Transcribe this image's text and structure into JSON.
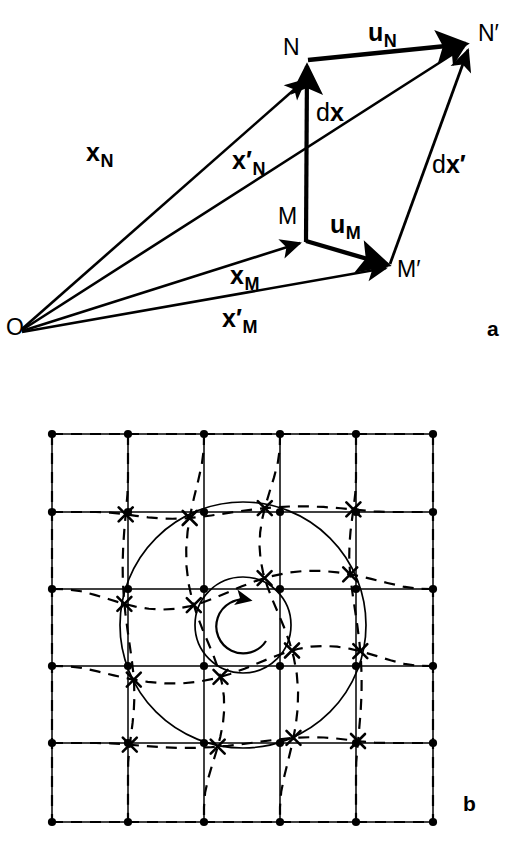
{
  "figure": {
    "background_color": "#ffffff",
    "ink_color": "#000000",
    "width": 526,
    "height": 848
  },
  "panel_a": {
    "tag": "a",
    "description": "Vector parallelogram showing position vectors from origin O to material points M and N, their displaced positions M' and N', displacement vectors u_M and u_N, and line elements dx and dx'.",
    "points": [
      {
        "name": "O",
        "label": "O",
        "x": 20,
        "y": 330
      },
      {
        "name": "M",
        "label": "M",
        "x": 305,
        "y": 240
      },
      {
        "name": "N",
        "label": "N",
        "x": 310,
        "y": 75
      },
      {
        "name": "Mp",
        "label": "M′",
        "x": 390,
        "y": 267
      },
      {
        "name": "Np",
        "label": "N′",
        "x": 470,
        "y": 42
      }
    ],
    "point_labels": [
      {
        "name": "label-O",
        "text": "O",
        "x": 6,
        "y": 316
      },
      {
        "name": "label-N",
        "text": "N",
        "x": 283,
        "y": 36
      },
      {
        "name": "label-Np",
        "text": "N′",
        "x": 478,
        "y": 22
      },
      {
        "name": "label-M",
        "text": "M",
        "x": 278,
        "y": 205
      },
      {
        "name": "label-Mp",
        "text": "M′",
        "x": 397,
        "y": 258
      }
    ],
    "vector_labels": [
      {
        "name": "label-x-N",
        "base": "x",
        "sub": "N",
        "prime": false,
        "upright": "",
        "x": 86,
        "y": 140
      },
      {
        "name": "label-x-N-prime",
        "base": "x",
        "sub": "N",
        "prime": true,
        "upright": "",
        "x": 232,
        "y": 148
      },
      {
        "name": "label-x-M",
        "base": "x",
        "sub": "M",
        "prime": false,
        "upright": "",
        "x": 230,
        "y": 263
      },
      {
        "name": "label-x-M-prime",
        "base": "x",
        "sub": "M",
        "prime": true,
        "upright": "",
        "x": 222,
        "y": 306
      },
      {
        "name": "label-u-N",
        "base": "u",
        "sub": "N",
        "prime": false,
        "upright": "",
        "x": 368,
        "y": 20
      },
      {
        "name": "label-u-M",
        "base": "u",
        "sub": "M",
        "prime": false,
        "upright": "",
        "x": 330,
        "y": 212
      },
      {
        "name": "label-dx",
        "base": "x",
        "sub": "",
        "prime": false,
        "upright": "d",
        "x": 316,
        "y": 100
      },
      {
        "name": "label-dx-prime",
        "base": "x",
        "sub": "",
        "prime": true,
        "upright": "d",
        "x": 432,
        "y": 152
      }
    ],
    "arrows": [
      {
        "name": "arrow-x-N",
        "from": "O",
        "to": "N",
        "label": "x_N",
        "weight": "thin"
      },
      {
        "name": "arrow-x-N-prime",
        "from": "O",
        "to": "Np",
        "label": "x'_N",
        "weight": "thin"
      },
      {
        "name": "arrow-x-M",
        "from": "O",
        "to": "M",
        "label": "x_M",
        "weight": "thin"
      },
      {
        "name": "arrow-x-M-prime",
        "from": "O",
        "to": "Mp",
        "label": "x'_M",
        "weight": "thin"
      },
      {
        "name": "arrow-u-N",
        "from": "N",
        "to": "Np",
        "label": "u_N",
        "weight": "thick"
      },
      {
        "name": "arrow-u-M",
        "from": "M",
        "to": "Mp",
        "label": "u_M",
        "weight": "thick"
      },
      {
        "name": "arrow-dx",
        "from": "M",
        "to": "N",
        "label": "dx",
        "weight": "thick"
      },
      {
        "name": "arrow-dx-prime",
        "from": "Mp",
        "to": "Np",
        "label": "dx'",
        "weight": "thin"
      }
    ]
  },
  "panel_b": {
    "tag": "b",
    "description": "Square reference grid (solid, dots at nodes) and the same grid after a localized rotational deformation (dashed, crosses at nodes), with two concentric circles and a counterclockwise rotation arrow at the centre.",
    "grid": {
      "columns": 5,
      "rows": 5,
      "x_positions": [
        52,
        128,
        204,
        280,
        356,
        433
      ],
      "y_positions": [
        434,
        512,
        589,
        666,
        743,
        822
      ],
      "node_marker": "dot",
      "line_style": "solid"
    },
    "deformed_grid": {
      "node_marker": "cross",
      "line_style": "dashed",
      "rotation_center": [
        243,
        625
      ],
      "max_rotation_deg": 26,
      "falloff_radius": 185
    },
    "circles": [
      {
        "name": "outer-circle",
        "cx": 243,
        "cy": 625,
        "r": 123
      },
      {
        "name": "inner-circle",
        "cx": 243,
        "cy": 625,
        "r": 48
      }
    ],
    "rotation_arrow": {
      "name": "rotation-arrow",
      "cx": 243,
      "cy": 627,
      "r": 28,
      "direction": "counterclockwise"
    }
  }
}
